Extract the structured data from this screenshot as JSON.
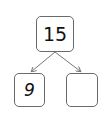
{
  "diagram": {
    "type": "number-bond",
    "whole": "15",
    "parts": [
      {
        "value": "9"
      },
      {
        "value": ""
      }
    ],
    "colors": {
      "border": "#6a6a6a",
      "arrow": "#777777",
      "text": "#111111"
    }
  }
}
